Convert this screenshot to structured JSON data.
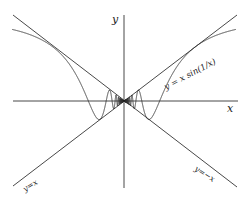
{
  "figure": {
    "labels": {
      "y_axis": "y",
      "x_axis": "x",
      "curve": "y = x sin(1/x)",
      "line_pos": "y=x",
      "line_neg": "y=−x"
    },
    "colors": {
      "stroke": "#333333",
      "background": "#ffffff"
    }
  },
  "chart_data": {
    "type": "line",
    "title": "",
    "xlabel": "x",
    "ylabel": "y",
    "series": [
      {
        "name": "y = x sin(1/x)",
        "function": "x*sin(1/x)"
      },
      {
        "name": "y=x",
        "function": "x"
      },
      {
        "name": "y=-x",
        "function": "-x"
      }
    ],
    "grid": false,
    "legend": "inline annotations"
  }
}
